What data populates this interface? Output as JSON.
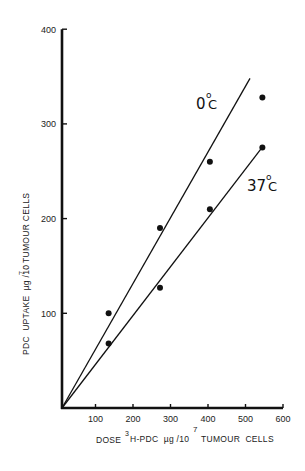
{
  "chart_data": {
    "type": "scatter",
    "title": "",
    "xlabel": "DOSE ³H-PDC µg /10⁷ TUMOUR CELLS",
    "xlabel_parts": {
      "prefix": "DOSE",
      "sup_3": "3",
      "main": "H-PDC  µg /10",
      "sup_7": "7",
      "suffix": "TUMOUR  CELLS"
    },
    "ylabel": "PDC UPTAKE µg /10⁷ TUMOUR CELLS",
    "ylabel_parts": {
      "main": "PDC  UPTAKE  µg /10",
      "sup": "7",
      "suffix": "TUMOUR CELLS"
    },
    "xlim": [
      0,
      600
    ],
    "ylim": [
      0,
      400
    ],
    "xticks": [
      100,
      200,
      300,
      400,
      500,
      600
    ],
    "yticks": [
      100,
      200,
      300,
      400
    ],
    "grid": false,
    "legend": "inline labels",
    "series": [
      {
        "name": "0°C",
        "label_main": "0",
        "label_deg": "o",
        "label_unit": "C",
        "points": [
          [
            135,
            100
          ],
          [
            272,
            190
          ],
          [
            405,
            260
          ],
          [
            545,
            328
          ]
        ],
        "fit_line": [
          [
            10,
            0
          ],
          [
            512,
            348
          ]
        ]
      },
      {
        "name": "37°C",
        "label_main": "37",
        "label_deg": "o",
        "label_unit": "C",
        "points": [
          [
            135,
            68
          ],
          [
            272,
            127
          ],
          [
            405,
            210
          ],
          [
            545,
            275
          ]
        ],
        "fit_line": [
          [
            10,
            0
          ],
          [
            548,
            277
          ]
        ]
      }
    ]
  }
}
